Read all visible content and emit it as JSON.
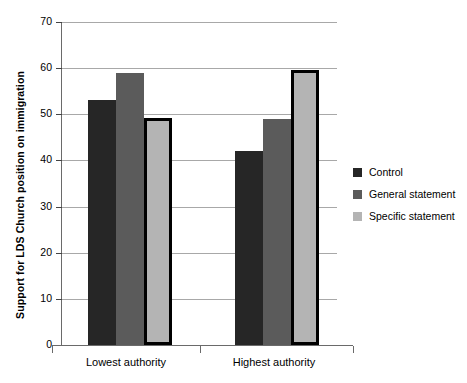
{
  "chart_data": {
    "type": "bar",
    "title": "",
    "xlabel": "",
    "ylabel": "Support for LDS Church position on immigration",
    "categories": [
      "Lowest authority",
      "Highest authority"
    ],
    "series": [
      {
        "name": "Control",
        "color": "#262626",
        "values": [
          53.0,
          42.0
        ]
      },
      {
        "name": "General statement",
        "color": "#5b5b5b",
        "values": [
          59.0,
          49.0
        ]
      },
      {
        "name": "Specific statement",
        "color": "#b4b4b4",
        "values": [
          49.3,
          59.5
        ]
      }
    ],
    "ylim": [
      0,
      70
    ],
    "yticks": [
      0,
      10,
      20,
      30,
      40,
      50,
      60,
      70
    ],
    "ytick_labels": [
      "0",
      "10",
      "20",
      "30",
      "40",
      "50",
      "60",
      "70"
    ],
    "grid": "horizontal",
    "legend_position": "right"
  },
  "legend": {
    "items": [
      {
        "label": "Control"
      },
      {
        "label": "General statement"
      },
      {
        "label": "Specific statement"
      }
    ]
  }
}
